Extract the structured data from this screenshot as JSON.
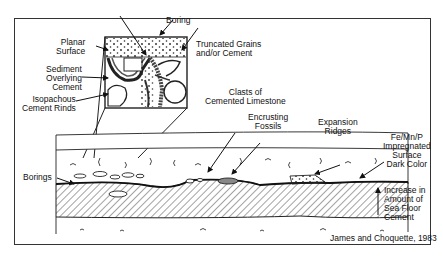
{
  "diagram": {
    "inset_labels": {
      "boring": "Boring",
      "planar_surface": [
        "Planar",
        "Surface"
      ],
      "truncated": [
        "Truncated Grains",
        "and/or Cement"
      ],
      "sediment_overlying": [
        "Sediment",
        "Overlying",
        "Cement"
      ],
      "isopachous": [
        "Isopachous",
        "Cement Rinds"
      ]
    },
    "section_labels": {
      "clasts": [
        "Clasts of",
        "Cemented Limestone"
      ],
      "encrusting": [
        "Encrusting",
        "Fossils"
      ],
      "expansion": [
        "Expansion",
        "Ridges"
      ],
      "fe_mn_p": [
        "Fe/Mn/P",
        "Impregnated",
        "Surface",
        "Dark Color"
      ],
      "borings": "Borings",
      "increase": [
        "Increase in",
        "Amount of",
        "Sea Floor",
        "Cement"
      ]
    },
    "citation": "James and Choquette, 1983",
    "colors": {
      "line": "#222222",
      "background": "#ffffff"
    }
  }
}
